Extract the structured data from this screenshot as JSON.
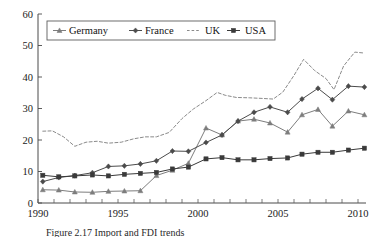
{
  "figure": {
    "caption": "Figure 2.17  Import and FDI trends"
  },
  "chart_data": {
    "type": "line",
    "title": "",
    "xlabel": "",
    "ylabel": "",
    "xlim": [
      1990,
      2010.5
    ],
    "ylim": [
      0,
      60
    ],
    "yticks": [
      0,
      10,
      20,
      30,
      40,
      50,
      60
    ],
    "xticks": [
      1990,
      1995,
      2000,
      2005,
      2010
    ],
    "xtick_labels": [
      "1990",
      "1995",
      "2000",
      "2005",
      "2010"
    ],
    "ytick_labels": [
      "0",
      "10",
      "20",
      "30",
      "40",
      "50",
      "60"
    ],
    "minor_xticks_every": 1,
    "grid": false,
    "legend_position": "top-left",
    "colors": {
      "germany": "#7d7d7d",
      "france": "#4b4b4b",
      "uk": "#8a8a8a",
      "usa": "#3a3a3a",
      "axis": "#4a4a4a",
      "text": "#111111",
      "background": "#ffffff"
    },
    "series": [
      {
        "name": "Germany",
        "marker": "triangle",
        "dash": "solid",
        "color": "#7d7d7d",
        "x": [
          1990.3,
          1991.3,
          1992.3,
          1993.4,
          1994.4,
          1995.4,
          1996.4,
          1997.4,
          1998.4,
          1999.4,
          2000.5,
          2001.5,
          2002.5,
          2003.5,
          2004.5,
          2005.6,
          2006.5,
          2007.5,
          2008.4,
          2009.4,
          2010.4
        ],
        "values": [
          4.2,
          4.1,
          3.5,
          3.4,
          3.7,
          3.8,
          3.9,
          8.7,
          10.4,
          12.6,
          23.8,
          21.6,
          26.0,
          26.6,
          25.4,
          22.5,
          28.0,
          29.7,
          24.4,
          29.2,
          28.0
        ]
      },
      {
        "name": "France",
        "marker": "diamond",
        "dash": "solid",
        "color": "#4b4b4b",
        "x": [
          1990.3,
          1991.3,
          1992.3,
          1993.4,
          1994.4,
          1995.4,
          1996.4,
          1997.4,
          1998.4,
          1999.4,
          2000.5,
          2001.5,
          2002.5,
          2003.5,
          2004.5,
          2005.6,
          2006.5,
          2007.5,
          2008.4,
          2009.4,
          2010.4
        ],
        "values": [
          6.8,
          8.1,
          8.7,
          9.6,
          11.6,
          11.8,
          12.4,
          13.4,
          16.5,
          16.4,
          19.2,
          21.6,
          26.0,
          28.8,
          30.5,
          28.8,
          33.0,
          36.4,
          32.8,
          37.1,
          36.8
        ]
      },
      {
        "name": "UK",
        "marker": "none",
        "dash": "dashed",
        "color": "#8a8a8a",
        "x": [
          1990.3,
          1990.9,
          1991.6,
          1992.3,
          1993.0,
          1993.7,
          1994.4,
          1995.2,
          1996.0,
          1996.7,
          1997.4,
          1998.2,
          1999.0,
          1999.7,
          2000.5,
          2001.2,
          2001.7,
          2002.4,
          2003.2,
          2004.0,
          2004.7,
          2005.3,
          2006.0,
          2006.6,
          2007.3,
          2008.0,
          2008.5,
          2009.1,
          2009.8,
          2010.4
        ],
        "values": [
          22.8,
          22.9,
          21.0,
          18.0,
          19.3,
          19.6,
          19.0,
          19.3,
          20.4,
          21.0,
          21.0,
          22.4,
          26.8,
          29.8,
          32.5,
          35.1,
          34.2,
          33.5,
          33.4,
          33.2,
          33.0,
          35.2,
          40.5,
          45.6,
          42.0,
          39.5,
          36.0,
          43.5,
          47.9,
          47.6
        ]
      },
      {
        "name": "USA",
        "marker": "square",
        "dash": "solid",
        "color": "#3a3a3a",
        "x": [
          1990.3,
          1991.3,
          1992.3,
          1993.4,
          1994.4,
          1995.4,
          1996.4,
          1997.4,
          1998.4,
          1999.4,
          2000.5,
          2001.5,
          2002.5,
          2003.5,
          2004.5,
          2005.6,
          2006.5,
          2007.5,
          2008.4,
          2009.4,
          2010.4
        ],
        "values": [
          8.8,
          8.3,
          8.6,
          8.9,
          8.6,
          9.1,
          9.4,
          9.7,
          10.8,
          11.4,
          14.0,
          14.4,
          13.7,
          13.7,
          14.1,
          14.3,
          15.5,
          16.1,
          16.1,
          16.8,
          17.4
        ]
      }
    ],
    "legend": [
      {
        "label": "Germany",
        "marker": "triangle",
        "dash": "solid",
        "color": "#7d7d7d"
      },
      {
        "label": "France",
        "marker": "diamond",
        "dash": "solid",
        "color": "#4b4b4b"
      },
      {
        "label": "UK",
        "marker": "none",
        "dash": "dashed",
        "color": "#8a8a8a"
      },
      {
        "label": "USA",
        "marker": "square",
        "dash": "solid",
        "color": "#3a3a3a"
      }
    ]
  }
}
